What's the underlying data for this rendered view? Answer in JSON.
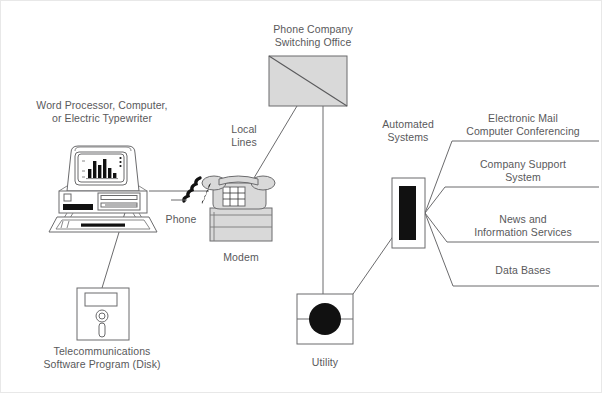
{
  "diagram": {
    "type": "block-diagram",
    "stroke_color": "#59595b",
    "fill_gray": "#d9d9d9",
    "fill_black": "#111111",
    "background": "#ffffff",
    "labels": {
      "word_processor": "Word Processor, Computer,\nor Electric Typewriter",
      "telecom_software": "Telecommunications\nSoftware Program (Disk)",
      "phone": "Phone",
      "modem": "Modem",
      "local_lines": "Local\nLines",
      "switching_office": "Phone Company\nSwitching Office",
      "utility": "Utility",
      "automated_systems": "Automated\nSystems",
      "electronic_mail": "Electronic Mail\nComputer Conferencing",
      "company_support": "Company Support\nSystem",
      "news_info": "News and\nInformation Services",
      "data_bases": "Data Bases"
    },
    "nodes": [
      {
        "id": "computer",
        "name": "Word Processor, Computer, or Electric Typewriter",
        "x": 100,
        "y": 190
      },
      {
        "id": "disk",
        "name": "Telecommunications Software Program (Disk)",
        "x": 101,
        "y": 315
      },
      {
        "id": "phone",
        "name": "Phone",
        "x": 228,
        "y": 197
      },
      {
        "id": "modem",
        "name": "Modem",
        "x": 231,
        "y": 230
      },
      {
        "id": "switching-office",
        "name": "Phone Company Switching Office",
        "x": 312,
        "y": 80
      },
      {
        "id": "utility",
        "name": "Utility",
        "x": 327,
        "y": 322
      },
      {
        "id": "automated-systems",
        "name": "Automated Systems",
        "x": 406,
        "y": 212
      },
      {
        "id": "service-electronic-mail",
        "name": "Electronic Mail / Computer Conferencing",
        "x": 520,
        "y": 125
      },
      {
        "id": "service-company-support",
        "name": "Company Support System",
        "x": 520,
        "y": 170
      },
      {
        "id": "service-news",
        "name": "News and Information Services",
        "x": 520,
        "y": 225
      },
      {
        "id": "service-databases",
        "name": "Data Bases",
        "x": 520,
        "y": 272
      }
    ],
    "connections": [
      {
        "from": "computer",
        "to": "phone",
        "label": ""
      },
      {
        "from": "disk",
        "to": "computer",
        "label": ""
      },
      {
        "from": "phone",
        "to": "switching-office",
        "label": "Local Lines"
      },
      {
        "from": "switching-office",
        "to": "utility",
        "label": ""
      },
      {
        "from": "utility",
        "to": "automated-systems",
        "label": ""
      },
      {
        "from": "automated-systems",
        "to": "service-electronic-mail",
        "label": ""
      },
      {
        "from": "automated-systems",
        "to": "service-company-support",
        "label": ""
      },
      {
        "from": "automated-systems",
        "to": "service-news",
        "label": ""
      },
      {
        "from": "automated-systems",
        "to": "service-databases",
        "label": ""
      }
    ]
  }
}
